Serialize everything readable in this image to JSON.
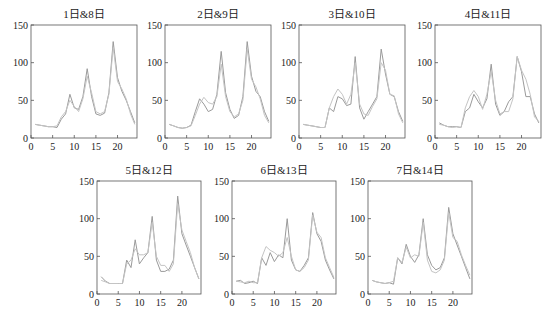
{
  "figure": {
    "line_colors": [
      "#9a9a9a",
      "#c4c4c4"
    ],
    "axis_color": "#555555"
  },
  "chart_data": [
    {
      "type": "line",
      "title": "1日&8日",
      "xlabel": "",
      "ylabel": "",
      "xlim": [
        0,
        24.5
      ],
      "ylim": [
        0,
        150
      ],
      "xticks": [
        0,
        5,
        10,
        15,
        20
      ],
      "yticks": [
        0,
        50,
        100,
        150
      ],
      "grid": false,
      "x": [
        1,
        2,
        3,
        4,
        5,
        6,
        7,
        8,
        9,
        10,
        11,
        12,
        13,
        14,
        15,
        16,
        17,
        18,
        19,
        20,
        21,
        22,
        23,
        24
      ],
      "series": [
        {
          "name": "1日",
          "values": [
            18,
            17,
            16,
            15,
            15,
            14,
            25,
            32,
            58,
            40,
            38,
            55,
            92,
            55,
            32,
            30,
            33,
            60,
            128,
            80,
            62,
            50,
            35,
            20
          ]
        },
        {
          "name": "8日",
          "values": [
            18,
            17,
            16,
            15,
            15,
            16,
            28,
            35,
            50,
            42,
            35,
            52,
            82,
            60,
            35,
            32,
            35,
            58,
            120,
            75,
            65,
            52,
            32,
            18
          ]
        }
      ]
    },
    {
      "type": "line",
      "title": "2日&9日",
      "xlabel": "",
      "ylabel": "",
      "xlim": [
        0,
        24.5
      ],
      "ylim": [
        0,
        150
      ],
      "xticks": [
        0,
        5,
        10,
        15,
        20
      ],
      "yticks": [
        0,
        50,
        100,
        150
      ],
      "grid": false,
      "x": [
        1,
        2,
        3,
        4,
        5,
        6,
        7,
        8,
        9,
        10,
        11,
        12,
        13,
        14,
        15,
        16,
        17,
        18,
        19,
        20,
        21,
        22,
        23,
        24
      ],
      "series": [
        {
          "name": "2日",
          "values": [
            18,
            16,
            14,
            13,
            14,
            17,
            35,
            52,
            45,
            35,
            38,
            58,
            115,
            60,
            38,
            26,
            30,
            55,
            128,
            82,
            62,
            55,
            35,
            22
          ]
        },
        {
          "name": "9日",
          "values": [
            18,
            16,
            14,
            13,
            14,
            16,
            30,
            45,
            54,
            47,
            45,
            55,
            98,
            55,
            35,
            28,
            32,
            50,
            118,
            78,
            68,
            52,
            30,
            20
          ]
        }
      ]
    },
    {
      "type": "line",
      "title": "3日&10日",
      "xlabel": "",
      "ylabel": "",
      "xlim": [
        0,
        24.5
      ],
      "ylim": [
        0,
        150
      ],
      "xticks": [
        0,
        5,
        10,
        15,
        20
      ],
      "yticks": [
        0,
        50,
        100,
        150
      ],
      "grid": false,
      "x": [
        1,
        2,
        3,
        4,
        5,
        6,
        7,
        8,
        9,
        10,
        11,
        12,
        13,
        14,
        15,
        16,
        17,
        18,
        19,
        20,
        21,
        22,
        23,
        24
      ],
      "series": [
        {
          "name": "3日",
          "values": [
            18,
            17,
            16,
            15,
            14,
            14,
            40,
            35,
            55,
            52,
            43,
            45,
            108,
            40,
            25,
            35,
            45,
            55,
            118,
            85,
            58,
            55,
            35,
            22
          ]
        },
        {
          "name": "10日",
          "values": [
            18,
            17,
            16,
            15,
            14,
            14,
            40,
            55,
            65,
            58,
            45,
            58,
            100,
            45,
            32,
            30,
            42,
            52,
            100,
            90,
            58,
            56,
            32,
            20
          ]
        }
      ]
    },
    {
      "type": "line",
      "title": "4日&11日",
      "xlabel": "",
      "ylabel": "",
      "xlim": [
        0,
        24.5
      ],
      "ylim": [
        0,
        150
      ],
      "xticks": [
        0,
        5,
        10,
        15,
        20
      ],
      "yticks": [
        0,
        50,
        100,
        150
      ],
      "grid": false,
      "x": [
        1,
        2,
        3,
        4,
        5,
        6,
        7,
        8,
        9,
        10,
        11,
        12,
        13,
        14,
        15,
        16,
        17,
        18,
        19,
        20,
        21,
        22,
        23,
        24
      ],
      "series": [
        {
          "name": "4日",
          "values": [
            20,
            17,
            15,
            15,
            15,
            14,
            35,
            40,
            58,
            48,
            40,
            52,
            98,
            45,
            30,
            35,
            48,
            55,
            108,
            88,
            55,
            55,
            32,
            20
          ]
        },
        {
          "name": "11日",
          "values": [
            18,
            17,
            15,
            14,
            15,
            14,
            40,
            55,
            63,
            55,
            38,
            58,
            88,
            50,
            32,
            35,
            35,
            52,
            108,
            90,
            78,
            58,
            28,
            22
          ]
        }
      ]
    },
    {
      "type": "line",
      "title": "5日&12日",
      "xlabel": "",
      "ylabel": "",
      "xlim": [
        0,
        24.5
      ],
      "ylim": [
        0,
        150
      ],
      "xticks": [
        0,
        5,
        10,
        15,
        20
      ],
      "yticks": [
        0,
        50,
        100,
        150
      ],
      "grid": false,
      "x": [
        1,
        2,
        3,
        4,
        5,
        6,
        7,
        8,
        9,
        10,
        11,
        12,
        13,
        14,
        15,
        16,
        17,
        18,
        19,
        20,
        21,
        22,
        23,
        24
      ],
      "series": [
        {
          "name": "5日",
          "values": [
            23,
            17,
            14,
            14,
            14,
            14,
            45,
            35,
            72,
            40,
            48,
            55,
            103,
            45,
            30,
            30,
            33,
            45,
            130,
            80,
            65,
            50,
            35,
            20
          ]
        },
        {
          "name": "12日",
          "values": [
            18,
            16,
            14,
            14,
            14,
            14,
            40,
            45,
            60,
            52,
            52,
            55,
            95,
            50,
            38,
            38,
            30,
            40,
            120,
            85,
            70,
            55,
            35,
            20
          ]
        }
      ]
    },
    {
      "type": "line",
      "title": "6日&13日",
      "xlabel": "",
      "ylabel": "",
      "xlim": [
        0,
        24.5
      ],
      "ylim": [
        0,
        150
      ],
      "xticks": [
        0,
        5,
        10,
        15,
        20
      ],
      "yticks": [
        0,
        50,
        100,
        150
      ],
      "grid": false,
      "x": [
        1,
        2,
        3,
        4,
        5,
        6,
        7,
        8,
        9,
        10,
        11,
        12,
        13,
        14,
        15,
        16,
        17,
        18,
        19,
        20,
        21,
        22,
        23,
        24
      ],
      "series": [
        {
          "name": "6日",
          "values": [
            17,
            18,
            14,
            15,
            17,
            14,
            48,
            38,
            55,
            43,
            52,
            48,
            100,
            45,
            32,
            30,
            38,
            48,
            108,
            80,
            70,
            45,
            32,
            20
          ]
        },
        {
          "name": "13日",
          "values": [
            17,
            16,
            15,
            17,
            15,
            15,
            48,
            63,
            58,
            55,
            50,
            55,
            75,
            50,
            32,
            30,
            35,
            45,
            105,
            82,
            75,
            48,
            35,
            22
          ]
        }
      ]
    },
    {
      "type": "line",
      "title": "7日&14日",
      "xlabel": "",
      "ylabel": "",
      "xlim": [
        0,
        24.5
      ],
      "ylim": [
        0,
        150
      ],
      "xticks": [
        0,
        5,
        10,
        15,
        20
      ],
      "yticks": [
        0,
        50,
        100,
        150
      ],
      "grid": false,
      "x": [
        1,
        2,
        3,
        4,
        5,
        6,
        7,
        8,
        9,
        10,
        11,
        12,
        13,
        14,
        15,
        16,
        17,
        18,
        19,
        20,
        21,
        22,
        23,
        24
      ],
      "series": [
        {
          "name": "7日",
          "values": [
            18,
            16,
            15,
            14,
            15,
            13,
            48,
            40,
            66,
            50,
            42,
            52,
            100,
            52,
            38,
            32,
            35,
            48,
            115,
            80,
            65,
            50,
            35,
            20
          ]
        },
        {
          "name": "14日",
          "values": [
            18,
            16,
            15,
            14,
            15,
            17,
            48,
            42,
            62,
            48,
            52,
            50,
            95,
            45,
            30,
            28,
            32,
            45,
            108,
            75,
            70,
            52,
            38,
            25
          ]
        }
      ]
    }
  ],
  "layout": {
    "panels": [
      {
        "left": 31,
        "top": 25,
        "width": 106,
        "height": 113
      },
      {
        "left": 165,
        "top": 25,
        "width": 106,
        "height": 113
      },
      {
        "left": 299,
        "top": 25,
        "width": 106,
        "height": 113
      },
      {
        "left": 435,
        "top": 25,
        "width": 106,
        "height": 113
      },
      {
        "left": 97,
        "top": 181,
        "width": 104,
        "height": 113
      },
      {
        "left": 232,
        "top": 181,
        "width": 104,
        "height": 113
      },
      {
        "left": 368,
        "top": 181,
        "width": 104,
        "height": 113
      }
    ]
  }
}
